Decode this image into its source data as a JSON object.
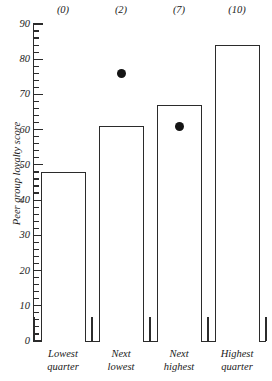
{
  "chart_data": {
    "type": "bar",
    "title": "",
    "subtitle": "",
    "xlabel": "",
    "ylabel": "Peer group loyalty score",
    "ylim": [
      0,
      90
    ],
    "ytick_step": 10,
    "yminor_step": 2,
    "grid": false,
    "legend": "none",
    "categories": [
      "Lowest quarter",
      "Next lowest",
      "Next highest",
      "Highest quarter"
    ],
    "category_lines": [
      [
        "Lowest",
        "quarter"
      ],
      [
        "Next",
        "lowest"
      ],
      [
        "Next",
        "highest"
      ],
      [
        "Highest",
        "quarter"
      ]
    ],
    "ytick_labels": [
      "0",
      "10",
      "20",
      "30",
      "40",
      "50",
      "60",
      "70",
      "80",
      "90"
    ],
    "series": [
      {
        "name": "Peer group loyalty score",
        "type": "bar",
        "values": [
          48,
          61,
          67,
          84
        ]
      },
      {
        "name": "Overlay point",
        "type": "scatter",
        "points": [
          {
            "category": "Next lowest",
            "value": 76
          },
          {
            "category": "Next highest",
            "value": 61
          }
        ]
      }
    ],
    "top_annotations": [
      "(0)",
      "(2)",
      "(7)",
      "(10)"
    ],
    "colors": {
      "bar_fill": "#ffffff",
      "bar_edge": "#2b2b2b",
      "dot": "#141414",
      "axis": "#2b2b2b",
      "text": "#1a1a1a",
      "background": "#ffffff"
    }
  }
}
